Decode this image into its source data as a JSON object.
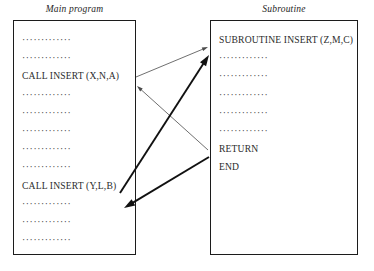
{
  "figure": {
    "kind": "flow-diagram"
  },
  "panels": {
    "main": {
      "caption": "Main program",
      "lines": [
        {
          "type": "dots",
          "text": "·············"
        },
        {
          "type": "dots",
          "text": "·············"
        },
        {
          "type": "code",
          "text": "CALL INSERT (X,N,A)"
        },
        {
          "type": "dots",
          "text": "·············"
        },
        {
          "type": "dots",
          "text": "·············"
        },
        {
          "type": "dots",
          "text": "·············"
        },
        {
          "type": "dots",
          "text": "·············"
        },
        {
          "type": "dots",
          "text": "·············"
        },
        {
          "type": "code",
          "text": "CALL INSERT (Y,L,B)"
        },
        {
          "type": "dots",
          "text": "·············"
        },
        {
          "type": "dots",
          "text": "·············"
        },
        {
          "type": "dots",
          "text": "·············"
        }
      ]
    },
    "subroutine": {
      "caption": "Subroutine",
      "lines": [
        {
          "type": "code",
          "text": "SUBROUTINE INSERT (Z,M,C)"
        },
        {
          "type": "dots",
          "text": "·············"
        },
        {
          "type": "dots",
          "text": "·············"
        },
        {
          "type": "dots",
          "text": "·············"
        },
        {
          "type": "dots",
          "text": "·············"
        },
        {
          "type": "dots",
          "text": "·············"
        },
        {
          "type": "code",
          "text": "RETURN"
        },
        {
          "type": "code",
          "text": "END"
        }
      ]
    }
  },
  "arrows": [
    {
      "name": "call-1-to-subroutine",
      "style": "thin",
      "from": "CALL INSERT (X,N,A)",
      "to": "SUBROUTINE INSERT (Z,M,C)",
      "x1": 136,
      "y1": 77,
      "x2": 208,
      "y2": 47
    },
    {
      "name": "return-1-to-call-1",
      "style": "thin",
      "from": "RETURN",
      "to": "after CALL INSERT (X,N,A)",
      "x1": 208,
      "y1": 150,
      "x2": 137,
      "y2": 86
    },
    {
      "name": "call-2-to-subroutine",
      "style": "thick",
      "from": "CALL INSERT (Y,L,B)",
      "to": "SUBROUTINE INSERT (Z,M,C)",
      "x1": 120,
      "y1": 193,
      "x2": 209,
      "y2": 55
    },
    {
      "name": "return-2-to-call-2",
      "style": "thick",
      "from": "RETURN",
      "to": "after CALL INSERT (Y,L,B)",
      "x1": 209,
      "y1": 157,
      "x2": 124,
      "y2": 208
    }
  ],
  "colors": {
    "ink": "#1c1c1c",
    "text": "#2b2b2b",
    "thin_stroke": "#4a4a4a",
    "thick_stroke": "#111111",
    "background": "#ffffff"
  }
}
